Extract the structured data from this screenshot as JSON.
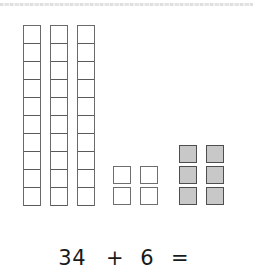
{
  "tens_rods": {
    "count": 3,
    "cells_per_rod": 10,
    "positions_x": [
      23,
      50,
      77
    ]
  },
  "unit_blocks_white": {
    "count": 4,
    "positions": [
      [
        113,
        166
      ],
      [
        140,
        166
      ],
      [
        113,
        187
      ],
      [
        140,
        187
      ]
    ]
  },
  "unit_blocks_shaded": {
    "count": 6,
    "fill_color": "#c8c8c8",
    "positions": [
      [
        179,
        145
      ],
      [
        206,
        145
      ],
      [
        179,
        166
      ],
      [
        206,
        166
      ],
      [
        179,
        187
      ],
      [
        206,
        187
      ]
    ]
  },
  "equation": {
    "operand1": "34",
    "operator": "+",
    "operand2": "6",
    "equals": "="
  }
}
